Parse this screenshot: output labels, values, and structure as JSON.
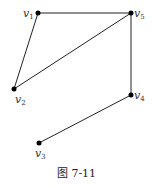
{
  "figure": {
    "caption": "图 7-11",
    "top_text_partial": "⋯⋯⋯⋯",
    "vertices": [
      {
        "id": "v1",
        "label": "v",
        "sub": "1",
        "x": 38,
        "y": 13,
        "lx": 23,
        "ly": 17
      },
      {
        "id": "v5",
        "label": "v",
        "sub": "5",
        "x": 131,
        "y": 13,
        "lx": 134,
        "ly": 17
      },
      {
        "id": "v2",
        "label": "v",
        "sub": "2",
        "x": 14,
        "y": 89,
        "lx": 15,
        "ly": 103
      },
      {
        "id": "v4",
        "label": "v",
        "sub": "4",
        "x": 131,
        "y": 95,
        "lx": 134,
        "ly": 99
      },
      {
        "id": "v3",
        "label": "v",
        "sub": "3",
        "x": 39,
        "y": 143,
        "lx": 35,
        "ly": 157
      }
    ],
    "edges": [
      [
        "v1",
        "v5"
      ],
      [
        "v1",
        "v2"
      ],
      [
        "v2",
        "v5"
      ],
      [
        "v5",
        "v4"
      ],
      [
        "v4",
        "v3"
      ]
    ]
  },
  "colors": {
    "line": "#222222",
    "vertex": "#000000",
    "label": "#333333"
  }
}
